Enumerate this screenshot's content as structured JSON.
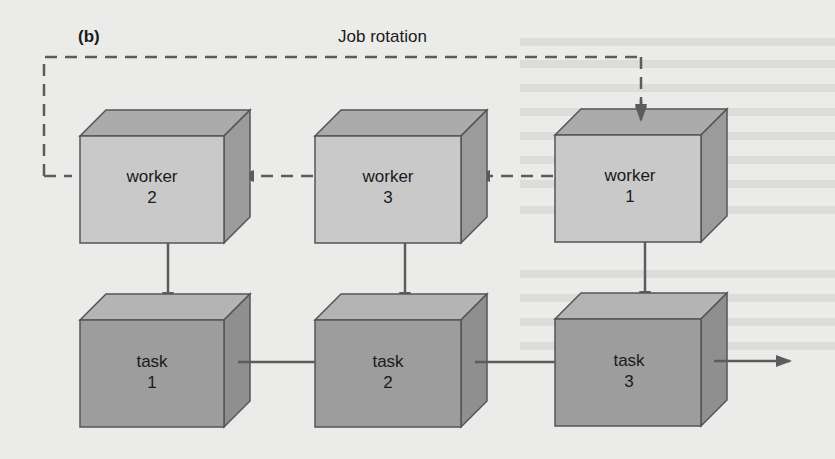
{
  "figure": {
    "panel_label": "(b)",
    "title": "Job rotation"
  },
  "workers": [
    {
      "id": "worker-2",
      "line1": "worker",
      "line2": "2"
    },
    {
      "id": "worker-3",
      "line1": "worker",
      "line2": "3"
    },
    {
      "id": "worker-1",
      "line1": "worker",
      "line2": "1"
    }
  ],
  "tasks": [
    {
      "id": "task-1",
      "line1": "task",
      "line2": "1"
    },
    {
      "id": "task-2",
      "line1": "task",
      "line2": "2"
    },
    {
      "id": "task-3",
      "line1": "task",
      "line2": "3"
    }
  ],
  "flows": {
    "rotation": [
      "worker 1 → worker 3",
      "worker 3 → worker 2",
      "worker 2 → worker 1"
    ],
    "assignment": [
      "worker 2 → task 1",
      "worker 3 → task 2",
      "worker 1 → task 3"
    ],
    "sequence": [
      "task 1 → task 2",
      "task 2 → task 3",
      "task 3 → output"
    ]
  },
  "colors": {
    "background": "#ebebea",
    "worker_front": "#c8c8c8",
    "worker_top": "#a9a9a9",
    "worker_side": "#9a9a9a",
    "task_front": "#9c9c9c",
    "task_top": "#b3b3b3",
    "task_side": "#8e8e8e",
    "edge": "#555555",
    "line": "#5c5c5c"
  }
}
